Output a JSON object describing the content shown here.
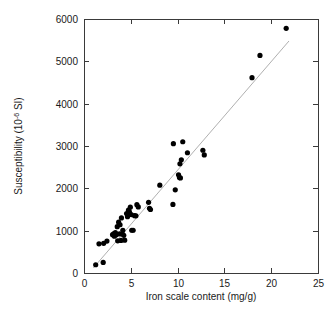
{
  "chart_data": {
    "type": "scatter",
    "title": "",
    "xlabel": "Iron scale content (mg/g)",
    "ylabel_prefix": "Susceptibility (10",
    "ylabel_sup": "-6",
    "ylabel_suffix": " SI)",
    "ylabel_full": "Susceptibility (10-6 SI)",
    "xlim": [
      0,
      25
    ],
    "ylim": [
      0,
      6000
    ],
    "xticks": [
      0,
      5,
      10,
      15,
      20,
      25
    ],
    "yticks": [
      0,
      1000,
      2000,
      3000,
      4000,
      5000,
      6000
    ],
    "xtick_labels": [
      "0",
      "5",
      "10",
      "15",
      "20",
      "25"
    ],
    "ytick_labels": [
      "0",
      "1000",
      "2000",
      "3000",
      "4000",
      "5000",
      "6000"
    ],
    "grid": false,
    "legend": null,
    "marker_color": "#000000",
    "marker_size": 2.6,
    "fit_line_color": "#b0b0b0",
    "fit_line": {
      "x1": 1.0,
      "y1": 120,
      "x2": 21.9,
      "y2": 5480,
      "slope": 256.5,
      "intercept": -136.5
    },
    "points": [
      {
        "x": 1.25,
        "y": 195
      },
      {
        "x": 2.05,
        "y": 250
      },
      {
        "x": 1.6,
        "y": 690
      },
      {
        "x": 2.1,
        "y": 700
      },
      {
        "x": 2.45,
        "y": 755
      },
      {
        "x": 3.05,
        "y": 905
      },
      {
        "x": 3.2,
        "y": 930
      },
      {
        "x": 3.25,
        "y": 870
      },
      {
        "x": 3.35,
        "y": 955
      },
      {
        "x": 3.45,
        "y": 905
      },
      {
        "x": 3.55,
        "y": 1095
      },
      {
        "x": 3.6,
        "y": 760
      },
      {
        "x": 3.7,
        "y": 1200
      },
      {
        "x": 3.8,
        "y": 925
      },
      {
        "x": 3.85,
        "y": 1140
      },
      {
        "x": 3.95,
        "y": 770
      },
      {
        "x": 4.0,
        "y": 1300
      },
      {
        "x": 4.1,
        "y": 920
      },
      {
        "x": 4.15,
        "y": 1010
      },
      {
        "x": 4.25,
        "y": 890
      },
      {
        "x": 4.35,
        "y": 775
      },
      {
        "x": 4.55,
        "y": 1405
      },
      {
        "x": 4.65,
        "y": 1330
      },
      {
        "x": 4.75,
        "y": 1485
      },
      {
        "x": 4.85,
        "y": 1445
      },
      {
        "x": 4.95,
        "y": 1555
      },
      {
        "x": 5.05,
        "y": 1380
      },
      {
        "x": 5.1,
        "y": 1010
      },
      {
        "x": 5.25,
        "y": 1010
      },
      {
        "x": 5.4,
        "y": 1355
      },
      {
        "x": 5.55,
        "y": 1350
      },
      {
        "x": 5.65,
        "y": 1615
      },
      {
        "x": 5.8,
        "y": 1560
      },
      {
        "x": 6.9,
        "y": 1670
      },
      {
        "x": 7.0,
        "y": 1530
      },
      {
        "x": 7.1,
        "y": 1500
      },
      {
        "x": 8.1,
        "y": 2075
      },
      {
        "x": 9.5,
        "y": 1620
      },
      {
        "x": 9.55,
        "y": 3055
      },
      {
        "x": 9.75,
        "y": 1965
      },
      {
        "x": 10.2,
        "y": 2255
      },
      {
        "x": 10.25,
        "y": 2580
      },
      {
        "x": 10.3,
        "y": 2245
      },
      {
        "x": 10.4,
        "y": 2675
      },
      {
        "x": 10.55,
        "y": 3100
      },
      {
        "x": 10.1,
        "y": 2320
      },
      {
        "x": 11.05,
        "y": 2840
      },
      {
        "x": 12.7,
        "y": 2900
      },
      {
        "x": 12.85,
        "y": 2790
      },
      {
        "x": 17.95,
        "y": 4615
      },
      {
        "x": 18.8,
        "y": 5140
      },
      {
        "x": 21.6,
        "y": 5780
      }
    ]
  },
  "layout": {
    "plot_left": 84,
    "plot_right": 318,
    "plot_top": 19,
    "plot_bottom": 273
  }
}
